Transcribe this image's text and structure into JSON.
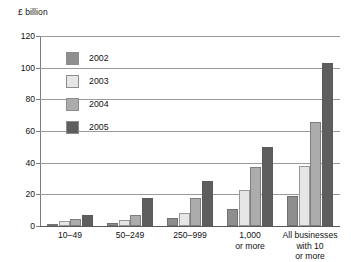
{
  "chart_data": {
    "type": "bar",
    "title": "",
    "ylabel": "£ billion",
    "xlabel": "",
    "ylim": [
      0,
      120
    ],
    "yticks": [
      0,
      20,
      40,
      60,
      80,
      100,
      120
    ],
    "ytick_labels": [
      "0",
      "20",
      "40",
      "60",
      "80",
      "100",
      "120"
    ],
    "grid": true,
    "legend_position": "inside-top-left",
    "categories": [
      "10–49",
      "50–249",
      "250–999",
      "1,000\nor more",
      "All businesses\nwith 10\nor more"
    ],
    "series": [
      {
        "name": "2002",
        "color": "#8e8e8e",
        "values": [
          1.5,
          2,
          5,
          11,
          19
        ]
      },
      {
        "name": "2003",
        "color": "#e6e6e6",
        "values": [
          3,
          4,
          8.5,
          23,
          38
        ]
      },
      {
        "name": "2004",
        "color": "#acacac",
        "values": [
          4.5,
          7,
          18,
          37,
          66
        ]
      },
      {
        "name": "2005",
        "color": "#5e5e5e",
        "values": [
          7,
          18,
          28.5,
          50,
          103
        ]
      }
    ]
  },
  "axis": {
    "unit_title": "£ billion"
  },
  "colors": {
    "gridline": "#9a9a9a",
    "axis": "#7d7d7d",
    "text": "#121212",
    "background": "#ffffff"
  }
}
